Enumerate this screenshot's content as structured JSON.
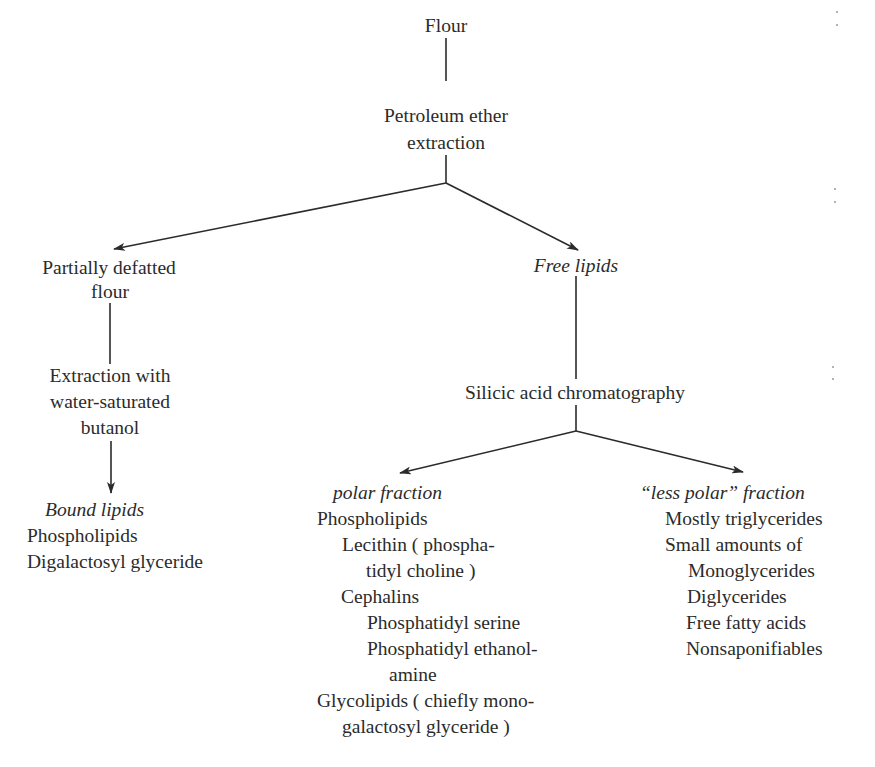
{
  "diagram": {
    "root": "Flour",
    "step1": [
      "Petroleum ether",
      "extraction"
    ],
    "left_branch": {
      "product": [
        "Partially defatted",
        "flour"
      ],
      "step": [
        "Extraction with",
        "water-saturated",
        "butanol"
      ],
      "result": {
        "heading": "Bound lipids",
        "items": [
          "Phospholipids",
          "Digalactosyl glyceride"
        ]
      }
    },
    "right_branch": {
      "product": "Free lipids",
      "step": "Silicic acid chromatography",
      "polar": {
        "heading": "polar fraction",
        "lines": [
          {
            "text": "Phospholipids",
            "indent": 0
          },
          {
            "text": "Lecithin ( phospha-",
            "indent": 1
          },
          {
            "text": "tidyl choline )",
            "indent": 2
          },
          {
            "text": "Cephalins",
            "indent": 1
          },
          {
            "text": "Phosphatidyl serine",
            "indent": 2
          },
          {
            "text": "Phosphatidyl ethanol-",
            "indent": 2
          },
          {
            "text": "amine",
            "indent": 3
          },
          {
            "text": "Glycolipids ( chiefly mono-",
            "indent": 0
          },
          {
            "text": "galactosyl glyceride )",
            "indent": 1
          }
        ]
      },
      "less_polar": {
        "heading": "“less polar” fraction",
        "lines": [
          {
            "text": "Mostly triglycerides",
            "indent": 0
          },
          {
            "text": "Small amounts of",
            "indent": 0
          },
          {
            "text": "Monoglycerides",
            "indent": 1
          },
          {
            "text": "Diglycerides",
            "indent": 1
          },
          {
            "text": "Free fatty acids",
            "indent": 1
          },
          {
            "text": "Nonsaponifiables",
            "indent": 1
          }
        ]
      }
    },
    "colors": {
      "ink": "#2b2b2b",
      "background": "#ffffff"
    }
  }
}
